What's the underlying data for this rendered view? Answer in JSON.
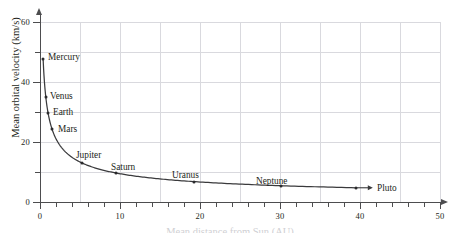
{
  "chart_data": {
    "type": "line",
    "title": "",
    "xlabel": "Mean distance from Sun (AU)",
    "ylabel": "Mean orbital velocity (km/s)",
    "xlim": [
      0,
      51
    ],
    "ylim": [
      0,
      63
    ],
    "grid": true,
    "legend": "none",
    "x_ticks": [
      0,
      10,
      20,
      30,
      40,
      50
    ],
    "x_tick_labels": [
      "0",
      "10",
      "20",
      "30",
      "40",
      "50"
    ],
    "x_minor_tick_step": 2,
    "y_ticks": [
      0,
      20,
      40,
      60
    ],
    "y_tick_labels": [
      "0",
      "20",
      "40",
      "60"
    ],
    "y_minor_tick_step": 10,
    "series": [
      {
        "name": "Planets",
        "x": [
          0.39,
          0.72,
          1.0,
          1.52,
          5.2,
          9.54,
          19.19,
          30.07,
          39.48
        ],
        "y": [
          47.9,
          35.0,
          29.8,
          24.1,
          13.1,
          9.6,
          6.8,
          5.4,
          4.7
        ]
      }
    ],
    "points": [
      {
        "label": "Mercury",
        "x": 0.39,
        "y": 47.9
      },
      {
        "label": "Venus",
        "x": 0.72,
        "y": 35.0
      },
      {
        "label": "Earth",
        "x": 1.0,
        "y": 29.8
      },
      {
        "label": "Mars",
        "x": 1.52,
        "y": 24.1
      },
      {
        "label": "Jupiter",
        "x": 5.2,
        "y": 13.1
      },
      {
        "label": "Saturn",
        "x": 9.54,
        "y": 9.6
      },
      {
        "label": "Uranus",
        "x": 19.19,
        "y": 6.8
      },
      {
        "label": "Neptune",
        "x": 30.07,
        "y": 5.4
      },
      {
        "label": "Pluto",
        "x": 39.48,
        "y": 4.7
      }
    ],
    "annotations": [
      {
        "name": "pluto-leader-arrow",
        "text": ""
      }
    ],
    "colors": {
      "curve": "#3a3a3c",
      "marker": "#2b2b2d",
      "grid": "#d9d9de",
      "axis": "#4d4d4f",
      "text": "#231f20",
      "background": "#ffffff"
    }
  }
}
